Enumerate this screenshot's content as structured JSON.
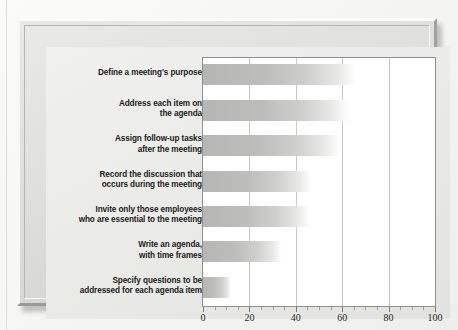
{
  "chart_data": {
    "type": "bar",
    "orientation": "horizontal",
    "title": "",
    "subtitle": "",
    "xlabel": "Percentage of Respondents",
    "ylabel": "",
    "xlim": [
      0,
      100
    ],
    "xticks": [
      "0",
      "20",
      "40",
      "60",
      "80",
      "100"
    ],
    "xtick_values": [
      0,
      20,
      40,
      60,
      80,
      100
    ],
    "minor_tick_step": 5,
    "grid": "vertical",
    "legend_position": "inside-bottom-right",
    "categories": [
      "Define a meeting's purpose",
      "Address each item on\nthe agenda",
      "Assign follow-up tasks\nafter the meeting",
      "Record the discussion that\noccurs during the meeting",
      "Invite only those employees\nwho are essential to the meeting",
      "Write an agenda,\nwith time frames",
      "Specify questions to be\naddressed for each agenda item"
    ],
    "values": [
      66,
      63,
      59,
      47,
      46,
      34,
      12
    ],
    "bar_color": "#b6b6b4",
    "bar_fade_color": "#ffffff",
    "plot_background": "#ffffff",
    "gridline_color": "#c9c9c6",
    "panel_background": "#eaeae7",
    "frame_color": "#dedeDA",
    "text_color": "#1b1b1b"
  },
  "legend": {
    "label": "Percentage\nof Respondents"
  }
}
